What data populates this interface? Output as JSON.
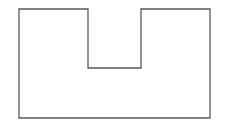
{
  "diagram": {
    "type": "polygon-outline",
    "shape": "U-shape (rectangle with top notch)",
    "stroke_color": "#5a5a5a",
    "fill_color": "#ffffff",
    "stroke_width": 1.3,
    "points": "19,9 88,9 88,68 141,68 141,9 210,9 210,118 19,118"
  }
}
